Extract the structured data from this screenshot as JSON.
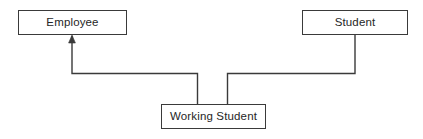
{
  "diagram": {
    "type": "uml-class-diagram",
    "title": "",
    "canvas": {
      "width": 423,
      "height": 139,
      "background_color": "#ffffff"
    },
    "style": {
      "line_color": "#3a3a3a",
      "box_border_color": "#3a3a3a",
      "box_fill_color": "#ffffff",
      "text_color": "#262626",
      "line_width": 1.4
    },
    "nodes": [
      {
        "id": "employee",
        "label": "Employee",
        "x": 18,
        "y": 10,
        "width": 109,
        "height": 25
      },
      {
        "id": "student",
        "label": "Student",
        "x": 302,
        "y": 10,
        "width": 106,
        "height": 25
      },
      {
        "id": "working_student",
        "label": "Working Student",
        "x": 161,
        "y": 104,
        "width": 105,
        "height": 25
      }
    ],
    "edges": [
      {
        "id": "working-student-to-employee",
        "from": "working_student",
        "to": "employee",
        "relationship": "generalization",
        "arrowhead": "filled-triangle",
        "arrowhead_at": "employee",
        "routing": "orthogonal",
        "path": "M 72 36 L 72 73.5 L 197.5 73.5 L 197.5 104"
      },
      {
        "id": "working-student-to-student",
        "from": "working_student",
        "to": "student",
        "relationship": "generalization",
        "arrowhead": "none",
        "routing": "orthogonal",
        "path": "M 355 35 L 355 73.5 L 227.5 73.5 L 227.5 104"
      }
    ],
    "arrowhead_marker": {
      "id": "generalization-arrowhead",
      "shape": "filled-triangle",
      "tip_x": 72,
      "tip_y": 35,
      "width": 7,
      "height": 8
    }
  }
}
